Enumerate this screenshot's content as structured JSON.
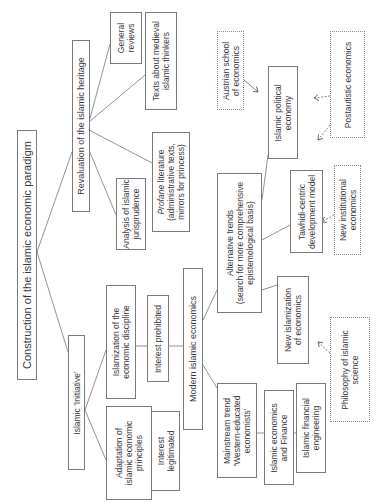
{
  "diagram": {
    "title": "Construction of the islamic economic paradigm",
    "nodes": {
      "root": "Construction of the islamic economic paradigm",
      "revaluation": "Revaluation of the islamic heritage",
      "general_reviews": "General\nreviews",
      "medieval_texts": "Texts about medieval\nislamic thinkers",
      "profane_italic": "Profane",
      "profane_rest": " literature\n(administrative texts,\nmirrors for princess)",
      "jurisprudence": "Analysis of islamic\njurisprudence",
      "initiative": "Islamic 'Initiative'",
      "islamization": "Islamization of the\neconomic discipline",
      "interest_prohibited": "Interest prohibited",
      "adaptation": "Adaptation of\nislamic economic\nprinciples",
      "interest_legitimated": "Interest\nlegitimated",
      "modern": "Modern islamic economics",
      "alternative": "Alternative trends\n(search for more comprehensive\nepistemological basis)",
      "mainstream": "Mainstream trend\n'Western-educated\neconomists'",
      "econ_finance": "Islamic economics\nand Finance",
      "fin_engineering": "Islamic financial\nengineering",
      "new_islamization": "New islamization\nof economics",
      "philosophy": "Philosophy of islamic\nscience",
      "tawhidi": "Tawhidi-centric\ndevelopment model",
      "new_institutional": "New institutional\neconomics",
      "political_economy": "Islamic political\neconomy",
      "austrian": "Austrian school\nof economics",
      "postautistic": "Postautistic economics"
    },
    "edges": [
      [
        "root",
        "revaluation"
      ],
      [
        "root",
        "initiative"
      ],
      [
        "revaluation",
        "general_reviews"
      ],
      [
        "revaluation",
        "medieval_texts"
      ],
      [
        "revaluation",
        "profane"
      ],
      [
        "revaluation",
        "jurisprudence"
      ],
      [
        "initiative",
        "islamization"
      ],
      [
        "initiative",
        "adaptation"
      ],
      [
        "islamization",
        "interest_prohibited"
      ],
      [
        "interest_prohibited",
        "modern"
      ],
      [
        "adaptation",
        "interest_legitimated"
      ],
      [
        "modern",
        "alternative"
      ],
      [
        "modern",
        "mainstream"
      ],
      [
        "mainstream",
        "econ_finance"
      ],
      [
        "econ_finance",
        "fin_engineering"
      ],
      [
        "alternative",
        "political_economy"
      ],
      [
        "alternative",
        "tawhidi"
      ],
      [
        "alternative",
        "new_islamization"
      ]
    ],
    "influences_dotted": [
      [
        "austrian",
        "political_economy"
      ],
      [
        "postautistic",
        "political_economy"
      ],
      [
        "postautistic",
        "tawhidi"
      ],
      [
        "new_institutional",
        "tawhidi"
      ],
      [
        "philosophy",
        "new_islamization"
      ]
    ]
  }
}
